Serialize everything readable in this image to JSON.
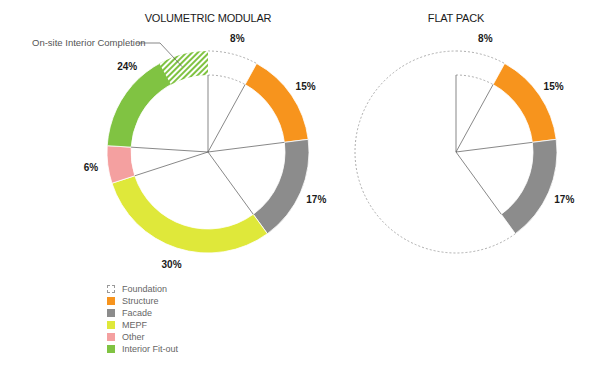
{
  "chart_data": [
    {
      "type": "pie",
      "subtype": "donut",
      "title": "VOLUMETRIC MODULAR",
      "categories": [
        "Foundation",
        "Structure",
        "Facade",
        "MEPF",
        "Other",
        "Interior Fit-out"
      ],
      "values": [
        8,
        15,
        17,
        30,
        6,
        24
      ],
      "labels": [
        "8%",
        "15%",
        "17%",
        "30%",
        "6%",
        "24%"
      ],
      "annotations": [
        {
          "text": "On-site Interior Completion",
          "category": "Interior Fit-out",
          "share_of_total_percent": 8,
          "style": "hatched"
        }
      ]
    },
    {
      "type": "pie",
      "subtype": "donut",
      "title": "FLAT PACK",
      "categories": [
        "Foundation",
        "Structure",
        "Facade"
      ],
      "values": [
        8,
        15,
        17
      ],
      "labels": [
        "8%",
        "15%",
        "17%"
      ],
      "remainder": "dashed outline, unfilled"
    }
  ],
  "legend": {
    "placement": "bottom-left",
    "items": [
      {
        "label": "Foundation",
        "color": "#ffffff",
        "style": "dashed"
      },
      {
        "label": "Structure",
        "color": "#f7941d"
      },
      {
        "label": "Facade",
        "color": "#8c8c8c"
      },
      {
        "label": "MEPF",
        "color": "#dfe83a"
      },
      {
        "label": "Other",
        "color": "#f4a0a0"
      },
      {
        "label": "Interior Fit-out",
        "color": "#80c342"
      }
    ]
  },
  "colors": {
    "Structure": "#f7941d",
    "Facade": "#8c8c8c",
    "MEPF": "#dfe83a",
    "Other": "#f4a0a0",
    "Interior Fit-out": "#80c342",
    "spoke": "#555555",
    "dashed": "#999999"
  }
}
